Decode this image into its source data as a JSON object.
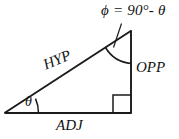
{
  "figure": {
    "type": "right-triangle-trigonometry-diagram",
    "background_color": "#ffffff",
    "line_color": "#1a1a1a",
    "labels": {
      "phi_equation": "ϕ = 90°- θ",
      "hypotenuse": "HYP",
      "opposite": "OPP",
      "adjacent": "ADJ",
      "theta": "θ"
    },
    "geometry": {
      "left_vertex": [
        5,
        113
      ],
      "top_vertex": [
        131,
        31
      ],
      "right_vertex": [
        131,
        113
      ],
      "right_angle_marker": true,
      "theta_arc": true,
      "phi_arc": true,
      "leader_line": true
    }
  }
}
